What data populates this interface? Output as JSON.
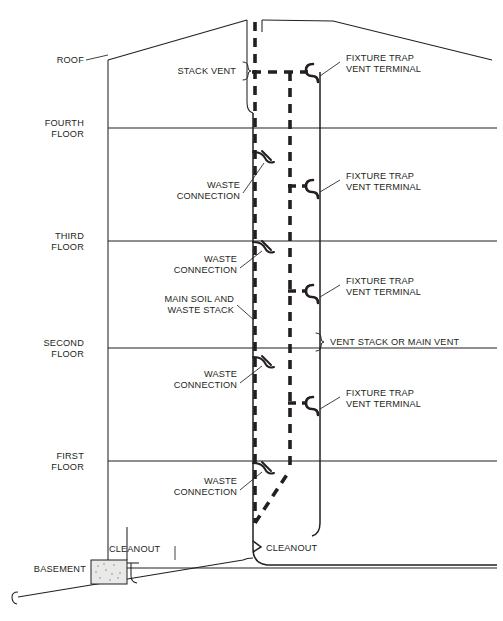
{
  "diagram": {
    "stroke_color": "#231f20",
    "background_color": "#ffffff",
    "accent_color": "#231f20"
  },
  "floor_labels": [
    {
      "id": "roof",
      "line1": "ROOF",
      "line2": "",
      "y": 60
    },
    {
      "id": "fourth",
      "line1": "FOURTH",
      "line2": "FLOOR",
      "y": 128
    },
    {
      "id": "third",
      "line1": "THIRD",
      "line2": "FLOOR",
      "y": 241
    },
    {
      "id": "second",
      "line1": "SECOND",
      "line2": "FLOOR",
      "y": 348
    },
    {
      "id": "first",
      "line1": "FIRST",
      "line2": "FLOOR",
      "y": 461
    },
    {
      "id": "basement",
      "line1": "BASEMENT",
      "line2": "",
      "y": 568
    }
  ],
  "callouts": {
    "stack_vent": "STACK VENT",
    "vent_stack_or_main_vent": "VENT STACK OR MAIN VENT",
    "main_soil_and_waste_stack_line1": "MAIN SOIL AND",
    "main_soil_and_waste_stack_line2": "WASTE STACK",
    "fixture_trap_vent_terminal_line1": "FIXTURE TRAP",
    "fixture_trap_vent_terminal_line2": "VENT TERMINAL",
    "waste_connection_line1": "WASTE",
    "waste_connection_line2": "CONNECTION",
    "cleanout_left": "CLEANOUT",
    "cleanout_right": "CLEANOUT"
  },
  "fixture_trap_vent_terminals": [
    {
      "id": "ftvt-roof",
      "y": 68,
      "label_y": 58
    },
    {
      "id": "ftvt-fourth",
      "y": 186,
      "label_y": 176
    },
    {
      "id": "ftvt-third",
      "y": 291,
      "label_y": 281
    },
    {
      "id": "ftvt-second",
      "y": 403,
      "label_y": 393
    }
  ],
  "waste_connections": [
    {
      "id": "wc-fourth",
      "y": 158,
      "label_y": 188
    },
    {
      "id": "wc-third",
      "y": 247,
      "label_y": 260
    },
    {
      "id": "wc-second",
      "y": 363,
      "label_y": 375
    },
    {
      "id": "wc-first",
      "y": 469,
      "label_y": 482
    }
  ],
  "geometry": {
    "wall_left_x": 108,
    "wall_right_x": 490,
    "soil_stack_x": 253,
    "vent_dashed_x": 290,
    "vent_stack_x": 320,
    "roof_peak_x": 333,
    "roof_peak_y": 20,
    "roof_left_y": 60,
    "roof_right_y": 60,
    "basement_line_y": 568,
    "sewer_left_x": 10,
    "sewer_left_y": 597
  }
}
